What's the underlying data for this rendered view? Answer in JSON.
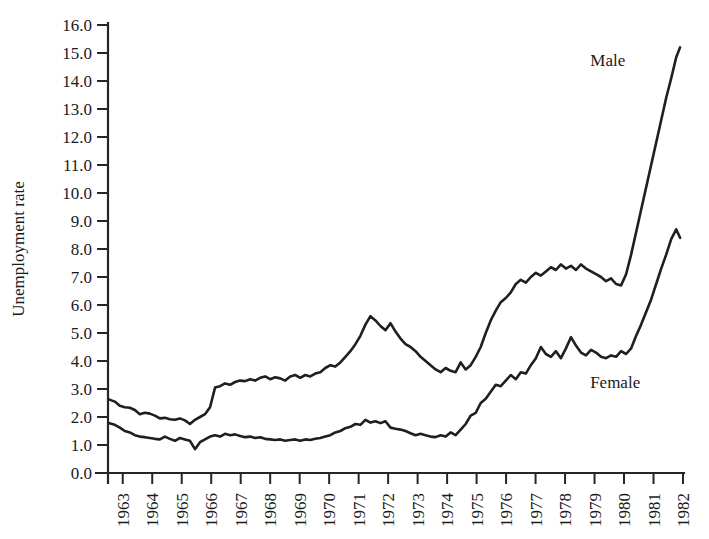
{
  "chart_data": {
    "type": "line",
    "title": "",
    "subtitle": "",
    "xlabel": "",
    "ylabel": "Unemployment rate",
    "xlim": [
      1962.5,
      1982.0
    ],
    "ylim": [
      0.0,
      16.0
    ],
    "grid": false,
    "legend_position": "inline-annotations",
    "y_ticks": [
      0.0,
      1.0,
      2.0,
      3.0,
      4.0,
      5.0,
      6.0,
      7.0,
      8.0,
      9.0,
      10.0,
      11.0,
      12.0,
      13.0,
      14.0,
      15.0,
      16.0
    ],
    "y_tick_labels": [
      "0.0",
      "1.0",
      "2.0",
      "3.0",
      "4.0",
      "5.0",
      "6.0",
      "7.0",
      "8.0",
      "9.0",
      "10.0",
      "11.0",
      "12.0",
      "13.0",
      "14.0",
      "15.0",
      "16.0"
    ],
    "x_ticks": [
      1963,
      1964,
      1965,
      1966,
      1967,
      1968,
      1969,
      1970,
      1971,
      1972,
      1973,
      1974,
      1975,
      1976,
      1977,
      1978,
      1979,
      1980,
      1981,
      1982
    ],
    "x_tick_labels": [
      "1963",
      "1964",
      "1965",
      "1966",
      "1967",
      "1968",
      "1969",
      "1970",
      "1971",
      "1972",
      "1973",
      "1974",
      "1975",
      "1976",
      "1977",
      "1978",
      "1979",
      "1980",
      "1981",
      "1982"
    ],
    "annotations": [
      {
        "text": "Male",
        "x": 1979.45,
        "y": 14.55
      },
      {
        "text": "Female",
        "x": 1979.7,
        "y": 3.05
      }
    ],
    "series": [
      {
        "name": "Male",
        "color": "#1f1f1f",
        "x": [
          1962.55,
          1962.73,
          1962.9,
          1963.07,
          1963.24,
          1963.41,
          1963.58,
          1963.75,
          1963.92,
          1964.09,
          1964.26,
          1964.43,
          1964.6,
          1964.77,
          1964.94,
          1965.11,
          1965.28,
          1965.45,
          1965.62,
          1965.79,
          1965.96,
          1966.13,
          1966.3,
          1966.47,
          1966.64,
          1966.81,
          1966.98,
          1967.15,
          1967.32,
          1967.49,
          1967.66,
          1967.83,
          1968.0,
          1968.17,
          1968.34,
          1968.51,
          1968.68,
          1968.85,
          1969.02,
          1969.19,
          1969.36,
          1969.53,
          1969.7,
          1969.87,
          1970.04,
          1970.21,
          1970.38,
          1970.55,
          1970.72,
          1970.89,
          1971.06,
          1971.23,
          1971.4,
          1971.57,
          1971.74,
          1971.91,
          1972.08,
          1972.25,
          1972.42,
          1972.59,
          1972.76,
          1972.93,
          1973.1,
          1973.27,
          1973.44,
          1973.61,
          1973.78,
          1973.95,
          1974.12,
          1974.29,
          1974.46,
          1974.63,
          1974.8,
          1974.97,
          1975.14,
          1975.31,
          1975.48,
          1975.65,
          1975.82,
          1975.99,
          1976.16,
          1976.33,
          1976.5,
          1976.67,
          1976.84,
          1977.01,
          1977.18,
          1977.35,
          1977.52,
          1977.69,
          1977.86,
          1978.03,
          1978.2,
          1978.37,
          1978.54,
          1978.71,
          1978.88,
          1979.05,
          1979.22,
          1979.39,
          1979.56,
          1979.73,
          1979.9,
          1980.07,
          1980.24,
          1980.41,
          1980.58,
          1980.75,
          1980.92,
          1981.09,
          1981.26,
          1981.43,
          1981.6,
          1981.77,
          1981.9
        ],
        "y": [
          2.62,
          2.55,
          2.4,
          2.35,
          2.33,
          2.25,
          2.1,
          2.15,
          2.12,
          2.05,
          1.95,
          1.97,
          1.92,
          1.9,
          1.95,
          1.88,
          1.75,
          1.9,
          2.0,
          2.1,
          2.35,
          3.05,
          3.1,
          3.2,
          3.15,
          3.25,
          3.3,
          3.28,
          3.35,
          3.3,
          3.4,
          3.45,
          3.35,
          3.42,
          3.38,
          3.3,
          3.45,
          3.5,
          3.4,
          3.5,
          3.45,
          3.55,
          3.6,
          3.75,
          3.85,
          3.8,
          3.95,
          4.15,
          4.35,
          4.6,
          4.9,
          5.3,
          5.6,
          5.45,
          5.25,
          5.1,
          5.35,
          5.05,
          4.8,
          4.6,
          4.5,
          4.35,
          4.15,
          4.0,
          3.85,
          3.7,
          3.6,
          3.75,
          3.65,
          3.6,
          3.95,
          3.7,
          3.85,
          4.15,
          4.5,
          5.0,
          5.45,
          5.8,
          6.1,
          6.25,
          6.45,
          6.75,
          6.9,
          6.8,
          7.0,
          7.15,
          7.05,
          7.2,
          7.35,
          7.25,
          7.45,
          7.3,
          7.4,
          7.25,
          7.45,
          7.3,
          7.2,
          7.1,
          7.0,
          6.85,
          6.95,
          6.75,
          6.7,
          7.1,
          7.8,
          8.6,
          9.4,
          10.2,
          11.0,
          11.8,
          12.6,
          13.4,
          14.1,
          14.85,
          15.2
        ]
      },
      {
        "name": "Female",
        "color": "#1f1f1f",
        "x": [
          1962.55,
          1962.73,
          1962.9,
          1963.07,
          1963.24,
          1963.41,
          1963.58,
          1963.75,
          1963.92,
          1964.09,
          1964.26,
          1964.43,
          1964.6,
          1964.77,
          1964.94,
          1965.11,
          1965.28,
          1965.45,
          1965.62,
          1965.79,
          1965.96,
          1966.13,
          1966.3,
          1966.47,
          1966.64,
          1966.81,
          1966.98,
          1967.15,
          1967.32,
          1967.49,
          1967.66,
          1967.83,
          1968.0,
          1968.17,
          1968.34,
          1968.51,
          1968.68,
          1968.85,
          1969.02,
          1969.19,
          1969.36,
          1969.53,
          1969.7,
          1969.87,
          1970.04,
          1970.21,
          1970.38,
          1970.55,
          1970.72,
          1970.89,
          1971.06,
          1971.23,
          1971.4,
          1971.57,
          1971.74,
          1971.91,
          1972.08,
          1972.25,
          1972.42,
          1972.59,
          1972.76,
          1972.93,
          1973.1,
          1973.27,
          1973.44,
          1973.61,
          1973.78,
          1973.95,
          1974.12,
          1974.29,
          1974.46,
          1974.63,
          1974.8,
          1974.97,
          1975.14,
          1975.31,
          1975.48,
          1975.65,
          1975.82,
          1975.99,
          1976.16,
          1976.33,
          1976.5,
          1976.67,
          1976.84,
          1977.01,
          1977.18,
          1977.35,
          1977.52,
          1977.69,
          1977.86,
          1978.03,
          1978.2,
          1978.37,
          1978.54,
          1978.71,
          1978.88,
          1979.05,
          1979.22,
          1979.39,
          1979.56,
          1979.73,
          1979.9,
          1980.07,
          1980.24,
          1980.41,
          1980.58,
          1980.75,
          1980.92,
          1981.09,
          1981.26,
          1981.43,
          1981.6,
          1981.77,
          1981.9
        ],
        "y": [
          1.78,
          1.72,
          1.62,
          1.5,
          1.45,
          1.35,
          1.3,
          1.28,
          1.25,
          1.22,
          1.2,
          1.3,
          1.22,
          1.15,
          1.25,
          1.2,
          1.15,
          0.85,
          1.1,
          1.2,
          1.3,
          1.35,
          1.3,
          1.4,
          1.35,
          1.38,
          1.32,
          1.28,
          1.3,
          1.25,
          1.28,
          1.22,
          1.2,
          1.18,
          1.2,
          1.15,
          1.18,
          1.2,
          1.15,
          1.2,
          1.18,
          1.22,
          1.25,
          1.3,
          1.35,
          1.45,
          1.5,
          1.6,
          1.65,
          1.75,
          1.72,
          1.9,
          1.8,
          1.85,
          1.78,
          1.85,
          1.62,
          1.58,
          1.55,
          1.5,
          1.42,
          1.35,
          1.4,
          1.35,
          1.3,
          1.28,
          1.35,
          1.3,
          1.45,
          1.35,
          1.55,
          1.75,
          2.05,
          2.15,
          2.5,
          2.65,
          2.9,
          3.15,
          3.1,
          3.3,
          3.5,
          3.35,
          3.6,
          3.55,
          3.85,
          4.1,
          4.5,
          4.25,
          4.15,
          4.35,
          4.1,
          4.45,
          4.85,
          4.55,
          4.3,
          4.2,
          4.4,
          4.3,
          4.15,
          4.1,
          4.2,
          4.15,
          4.35,
          4.25,
          4.45,
          4.9,
          5.3,
          5.75,
          6.2,
          6.75,
          7.3,
          7.8,
          8.35,
          8.7,
          8.4
        ]
      }
    ]
  },
  "plot_geometry": {
    "left": 108,
    "right": 683,
    "top": 25,
    "bottom": 473
  }
}
